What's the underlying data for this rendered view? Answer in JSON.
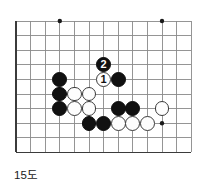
{
  "caption": "15도",
  "colors": {
    "black_stone": "#111111",
    "white_stone": "#fdfdfd",
    "white_stone_border": "#3a3a3a",
    "grid_line": "#8a8a8a",
    "board_edge": "#3b3b3b",
    "star_point": "#1a1a1a",
    "background": "#ffffff"
  },
  "board": {
    "type": "go-diagram",
    "cols": 13,
    "rows": 10,
    "cell": 14.6,
    "origin_x": 16,
    "origin_y": 21,
    "edges": {
      "left": true,
      "top": false,
      "right": false,
      "bottom": true
    },
    "star_points": [
      {
        "col": 3,
        "row": 0
      },
      {
        "col": 10,
        "row": 0
      },
      {
        "col": 10,
        "row": 7
      }
    ],
    "stones": [
      {
        "id": "b-c3r4",
        "color": "black",
        "col": 3,
        "row": 4,
        "label": ""
      },
      {
        "id": "b-c3r5",
        "color": "black",
        "col": 3,
        "row": 5,
        "label": ""
      },
      {
        "id": "b-c3r6",
        "color": "black",
        "col": 3,
        "row": 6,
        "label": ""
      },
      {
        "id": "b-c7r4",
        "color": "black",
        "col": 7,
        "row": 4,
        "label": ""
      },
      {
        "id": "b-c7r6",
        "color": "black",
        "col": 7,
        "row": 6,
        "label": ""
      },
      {
        "id": "b-c8r6",
        "color": "black",
        "col": 8,
        "row": 6,
        "label": ""
      },
      {
        "id": "b-c5r7",
        "color": "black",
        "col": 5,
        "row": 7,
        "label": ""
      },
      {
        "id": "b-c6r7",
        "color": "black",
        "col": 6,
        "row": 7,
        "label": ""
      },
      {
        "id": "w-c4r5",
        "color": "white",
        "col": 4,
        "row": 5,
        "label": ""
      },
      {
        "id": "w-c5r5",
        "color": "white",
        "col": 5,
        "row": 5,
        "label": ""
      },
      {
        "id": "w-c4r6",
        "color": "white",
        "col": 4,
        "row": 6,
        "label": ""
      },
      {
        "id": "w-c5r6",
        "color": "white",
        "col": 5,
        "row": 6,
        "label": ""
      },
      {
        "id": "w-c7r7",
        "color": "white",
        "col": 7,
        "row": 7,
        "label": ""
      },
      {
        "id": "w-c8r7",
        "color": "white",
        "col": 8,
        "row": 7,
        "label": ""
      },
      {
        "id": "w-c9r7",
        "color": "white",
        "col": 9,
        "row": 7,
        "label": ""
      },
      {
        "id": "w-c10r6",
        "color": "white",
        "col": 10,
        "row": 6,
        "label": ""
      },
      {
        "id": "w-move-1",
        "color": "white",
        "col": 6,
        "row": 4,
        "label": "1"
      },
      {
        "id": "b-move-2",
        "color": "black",
        "col": 6,
        "row": 3,
        "label": "2"
      }
    ]
  }
}
